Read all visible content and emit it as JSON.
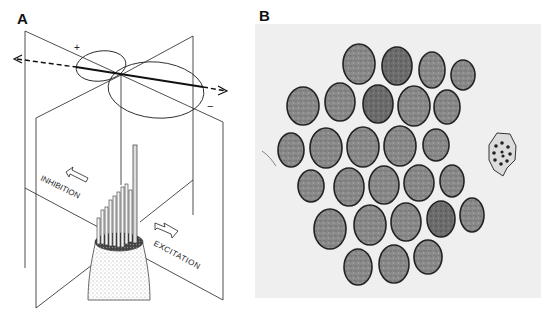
{
  "figure": {
    "panels": [
      {
        "label": "A",
        "title": "Hair cell directional sensitivity schematic",
        "annotations": {
          "plus_sign": "+",
          "minus_sign": "−",
          "inhibition": "INHIBITION",
          "excitation": "EXCITATION"
        }
      },
      {
        "label": "B",
        "title": "Electron micrograph cross-section of hair bundle",
        "stereocilia_count": 28,
        "kinocilium_count": 1
      }
    ],
    "colors": {
      "line": "#111111",
      "micrograph_bg": "#efefef",
      "cell_fill": "#7a7a7a",
      "cell_dark": "#5a5a5a",
      "cell_edge": "#222222"
    }
  }
}
